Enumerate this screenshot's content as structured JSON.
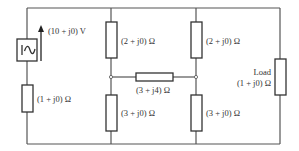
{
  "diagram": {
    "type": "circuit",
    "source": {
      "label": "(10 + j0) V",
      "symbol": "ac-voltage-source-icon"
    },
    "components": {
      "r_source": {
        "label": "(1 + j0) Ω"
      },
      "r_top_left": {
        "label": "(2 + j0) Ω"
      },
      "r_bottom_left": {
        "label": "(3 + j0) Ω"
      },
      "r_bridge": {
        "label": "(3 + j4) Ω"
      },
      "r_top_right": {
        "label": "(2 + j0) Ω"
      },
      "r_bottom_right": {
        "label": "(3 + j0) Ω"
      },
      "load": {
        "title": "Load",
        "label": "(1 + j0) Ω"
      }
    },
    "colors": {
      "wire": "#555555",
      "component": "#333333",
      "background": "#ffffff"
    }
  }
}
